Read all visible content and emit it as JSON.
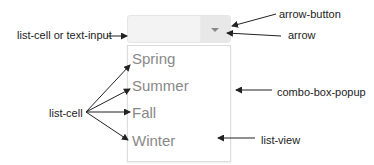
{
  "combo_box": {
    "text_input_value": "",
    "arrow_icon": "chevron-down-icon"
  },
  "list": {
    "items": [
      "Spring",
      "Summer",
      "Fall",
      "Winter"
    ]
  },
  "annotations": {
    "list_cell_or_text_input": "list-cell or text-input",
    "arrow_button": "arrow-button",
    "arrow": "arrow",
    "list_cell": "list-cell",
    "combo_box_popup": "combo-box-popup",
    "list_view": "list-view"
  },
  "colors": {
    "item_text": "#888888",
    "label_text": "#222222",
    "combo_bg": "#f3f3f3",
    "arrow_button_bg": "#e8e8e8"
  }
}
